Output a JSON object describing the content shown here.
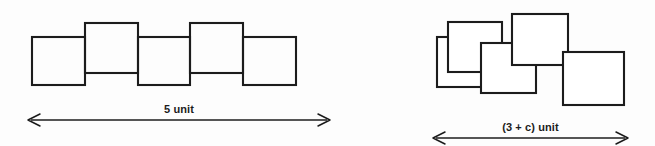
{
  "diagram": {
    "background_color": "#fdfdfd",
    "stroke_color": "#1c1c1c",
    "left_figure": {
      "name": "five-chained-squares",
      "description": "Five equal squares joined edge to edge in an alternating up-down zigzag arrangement",
      "square_count": 5,
      "overlap": "none",
      "measurement_label": "5 unit",
      "squares": [
        {
          "x": 32,
          "y": 37,
          "w": 53,
          "h": 48,
          "offset": "down"
        },
        {
          "x": 85,
          "y": 23,
          "w": 53,
          "h": 50,
          "offset": "up"
        },
        {
          "x": 138,
          "y": 37,
          "w": 52,
          "h": 48,
          "offset": "down"
        },
        {
          "x": 190,
          "y": 23,
          "w": 53,
          "h": 50,
          "offset": "up"
        },
        {
          "x": 243,
          "y": 37,
          "w": 53,
          "h": 48,
          "offset": "down"
        }
      ],
      "arrow": {
        "x1": 28,
        "x2": 330,
        "y": 120,
        "style": "double-headed"
      }
    },
    "right_figure": {
      "name": "five-overlapping-squares",
      "description": "Five equal squares arranged in a staggered overlapping chain so the total span is shorter",
      "square_count": 5,
      "overlap": "partial",
      "measurement_label": "(3 + c) unit",
      "squares": [
        {
          "x": 437,
          "y": 37,
          "w": 54,
          "h": 50
        },
        {
          "x": 448,
          "y": 22,
          "w": 54,
          "h": 50
        },
        {
          "x": 481,
          "y": 43,
          "w": 55,
          "h": 50
        },
        {
          "x": 512,
          "y": 14,
          "w": 56,
          "h": 51
        },
        {
          "x": 563,
          "y": 52,
          "w": 61,
          "h": 53
        }
      ],
      "arrow": {
        "x1": 433,
        "x2": 628,
        "y": 138,
        "style": "double-headed"
      }
    }
  },
  "labels": {
    "left_measure": "5 unit",
    "right_measure": "(3 + c) unit"
  }
}
